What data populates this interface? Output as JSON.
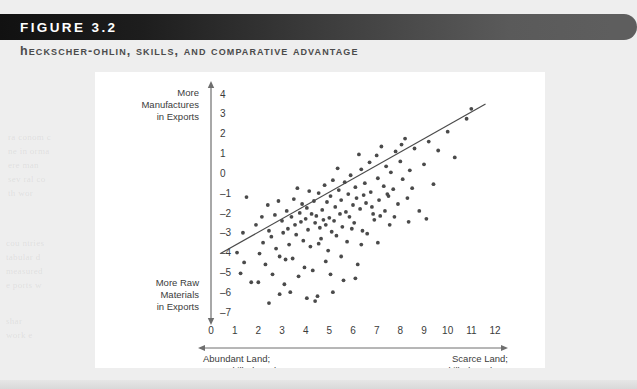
{
  "figure": {
    "badge_label": "FIGURE 3.2",
    "subtitle": "Heckscher-Ohlin, Skills, and Comparative Advantage"
  },
  "chart_data": {
    "type": "scatter",
    "title": "Heckscher-Ohlin, Skills, and Comparative Advantage",
    "xlabel": "",
    "ylabel": "",
    "xlim": [
      0,
      12
    ],
    "ylim": [
      -7,
      4
    ],
    "grid": false,
    "legend": null,
    "x_ticks": [
      "0",
      "1",
      "2",
      "3",
      "4",
      "5",
      "6",
      "7",
      "8",
      "9",
      "10",
      "11",
      "12"
    ],
    "y_ticks": [
      "4",
      "3",
      "2",
      "1",
      "0",
      "-1",
      "-2",
      "-3",
      "-4",
      "-5",
      "-6",
      "-7"
    ],
    "y_axis_top_label": [
      "More",
      "Manufactures",
      "in Exports"
    ],
    "y_axis_bottom_label": [
      "More Raw",
      "Materials",
      "in Exports"
    ],
    "x_axis_left_label": [
      "Abundant Land;",
      "Less-Skilled Workers"
    ],
    "x_axis_right_label": [
      "Scarce Land;",
      "More-Skilled Workers"
    ],
    "trendline": {
      "x0": 0.4,
      "y0": -4.05,
      "x1": 11.6,
      "y1": 3.5
    },
    "point_color": "#4a4a4a",
    "points": [
      [
        1.1,
        -4.0
      ],
      [
        1.4,
        -4.5
      ],
      [
        1.5,
        -1.2
      ],
      [
        1.7,
        -5.5
      ],
      [
        1.9,
        -2.6
      ],
      [
        2.0,
        -5.5
      ],
      [
        2.15,
        -2.2
      ],
      [
        2.2,
        -3.5
      ],
      [
        2.3,
        -4.6
      ],
      [
        2.4,
        -1.6
      ],
      [
        2.45,
        -2.9
      ],
      [
        2.55,
        -3.2
      ],
      [
        2.6,
        -5.1
      ],
      [
        2.7,
        -2.1
      ],
      [
        2.75,
        -3.8
      ],
      [
        2.85,
        -1.4
      ],
      [
        2.9,
        -4.2
      ],
      [
        3.0,
        -2.4
      ],
      [
        3.05,
        -3.0
      ],
      [
        3.1,
        -5.6
      ],
      [
        3.2,
        -1.9
      ],
      [
        3.25,
        -2.8
      ],
      [
        3.3,
        -3.6
      ],
      [
        3.4,
        -2.2
      ],
      [
        3.45,
        -4.3
      ],
      [
        3.5,
        -1.3
      ],
      [
        3.55,
        -2.6
      ],
      [
        3.6,
        -3.1
      ],
      [
        3.7,
        -5.2
      ],
      [
        3.75,
        -2.0
      ],
      [
        3.8,
        -2.45
      ],
      [
        3.85,
        -1.55
      ],
      [
        3.9,
        -3.4
      ],
      [
        3.95,
        -4.75
      ],
      [
        4.0,
        -2.3
      ],
      [
        4.05,
        -1.75
      ],
      [
        4.1,
        -2.85
      ],
      [
        4.15,
        -0.9
      ],
      [
        4.2,
        -3.7
      ],
      [
        4.25,
        -2.05
      ],
      [
        4.3,
        -4.9
      ],
      [
        4.35,
        -1.4
      ],
      [
        4.4,
        -2.5
      ],
      [
        4.45,
        -2.15
      ],
      [
        4.5,
        -6.2
      ],
      [
        4.55,
        -1.0
      ],
      [
        4.6,
        -2.75
      ],
      [
        4.65,
        -3.3
      ],
      [
        4.7,
        -1.85
      ],
      [
        4.75,
        -2.35
      ],
      [
        4.8,
        -0.6
      ],
      [
        4.85,
        -2.6
      ],
      [
        4.9,
        -1.45
      ],
      [
        4.95,
        -3.9
      ],
      [
        5.0,
        -2.25
      ],
      [
        5.05,
        -1.15
      ],
      [
        5.1,
        -2.95
      ],
      [
        5.15,
        -0.35
      ],
      [
        5.2,
        -2.4
      ],
      [
        5.25,
        -1.7
      ],
      [
        5.3,
        -3.15
      ],
      [
        5.4,
        -0.85
      ],
      [
        5.45,
        -2.05
      ],
      [
        5.5,
        -1.35
      ],
      [
        5.55,
        -2.7
      ],
      [
        5.6,
        -5.4
      ],
      [
        5.65,
        -0.45
      ],
      [
        5.7,
        -1.95
      ],
      [
        5.75,
        -3.45
      ],
      [
        5.8,
        -1.05
      ],
      [
        5.85,
        -2.2
      ],
      [
        5.9,
        -0.1
      ],
      [
        6.0,
        -1.6
      ],
      [
        6.05,
        -2.5
      ],
      [
        6.1,
        -0.7
      ],
      [
        6.15,
        -1.25
      ],
      [
        6.2,
        -4.6
      ],
      [
        6.3,
        -1.8
      ],
      [
        6.35,
        0.2
      ],
      [
        6.4,
        -2.9
      ],
      [
        6.45,
        -1.1
      ],
      [
        6.5,
        -0.5
      ],
      [
        6.55,
        -1.5
      ],
      [
        6.6,
        -3.05
      ],
      [
        6.7,
        0.55
      ],
      [
        6.75,
        -0.95
      ],
      [
        6.8,
        -1.7
      ],
      [
        6.9,
        -2.35
      ],
      [
        7.0,
        0.9
      ],
      [
        7.05,
        -0.25
      ],
      [
        7.1,
        -1.35
      ],
      [
        7.15,
        -2.15
      ],
      [
        7.2,
        1.35
      ],
      [
        7.3,
        -0.65
      ],
      [
        7.35,
        -1.9
      ],
      [
        7.4,
        0.35
      ],
      [
        7.5,
        -1.15
      ],
      [
        7.55,
        -2.6
      ],
      [
        7.6,
        0.05
      ],
      [
        7.7,
        -0.8
      ],
      [
        7.8,
        1.1
      ],
      [
        7.9,
        -1.55
      ],
      [
        8.0,
        0.6
      ],
      [
        8.1,
        -0.3
      ],
      [
        8.2,
        1.75
      ],
      [
        8.3,
        -1.25
      ],
      [
        8.4,
        0.15
      ],
      [
        8.5,
        -0.75
      ],
      [
        8.6,
        1.25
      ],
      [
        8.8,
        -1.9
      ],
      [
        9.0,
        0.45
      ],
      [
        9.2,
        1.6
      ],
      [
        9.4,
        -0.55
      ],
      [
        9.6,
        1.15
      ],
      [
        10.0,
        2.1
      ],
      [
        10.3,
        0.8
      ],
      [
        10.8,
        2.75
      ],
      [
        11.0,
        3.25
      ],
      [
        4.4,
        -6.45
      ],
      [
        4.05,
        -6.3
      ],
      [
        3.35,
        -6.0
      ],
      [
        2.45,
        -6.55
      ],
      [
        5.15,
        -6.0
      ],
      [
        6.1,
        -5.3
      ],
      [
        1.35,
        -3.0
      ],
      [
        1.25,
        -5.05
      ],
      [
        2.05,
        -4.05
      ],
      [
        2.9,
        -6.1
      ],
      [
        8.35,
        -2.45
      ],
      [
        9.1,
        -2.3
      ],
      [
        7.05,
        -3.5
      ],
      [
        6.35,
        -3.6
      ],
      [
        5.5,
        -4.2
      ],
      [
        4.85,
        -4.45
      ],
      [
        3.15,
        -4.35
      ],
      [
        6.85,
        -2.05
      ],
      [
        7.45,
        -1.05
      ],
      [
        5.95,
        -2.8
      ],
      [
        4.55,
        -3.55
      ],
      [
        3.65,
        -0.75
      ],
      [
        5.35,
        0.25
      ],
      [
        6.25,
        0.95
      ],
      [
        7.75,
        -2.2
      ],
      [
        8.05,
        1.45
      ],
      [
        5.05,
        -5.1
      ]
    ]
  },
  "background": {
    "ghost_lines": [
      {
        "text": "ra conom c",
        "x": 8,
        "y": 132
      },
      {
        "text": "ne in orma",
        "x": 8,
        "y": 146
      },
      {
        "text": "ere man",
        "x": 8,
        "y": 160
      },
      {
        "text": "sev ral co",
        "x": 8,
        "y": 174
      },
      {
        "text": "th wor",
        "x": 8,
        "y": 188
      },
      {
        "text": "cou ntries",
        "x": 6,
        "y": 238
      },
      {
        "text": "tabular d",
        "x": 6,
        "y": 252
      },
      {
        "text": "measured",
        "x": 6,
        "y": 266
      },
      {
        "text": "e ports w",
        "x": 6,
        "y": 280
      },
      {
        "text": "shar",
        "x": 6,
        "y": 316
      },
      {
        "text": "work e",
        "x": 6,
        "y": 330
      }
    ]
  }
}
